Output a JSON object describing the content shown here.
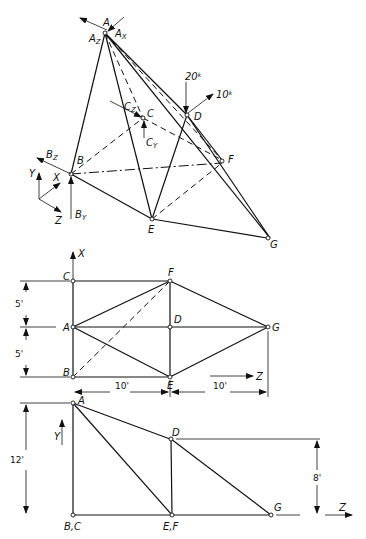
{
  "isometric": {
    "nodes": {
      "A": "A",
      "B": "B",
      "C": "C",
      "D": "D",
      "E": "E",
      "F": "F",
      "G": "G"
    },
    "reactions": {
      "Ax": "A",
      "Ax_sub": "X",
      "Az": "A",
      "Az_sub": "Z",
      "Bz": "B",
      "Bz_sub": "Z",
      "By": "B",
      "By_sub": "Y",
      "Cz": "C",
      "Cz_sub": "Z",
      "Cy": "C",
      "Cy_sub": "Y"
    },
    "loads": {
      "vertical": "20",
      "horizontal": "10",
      "unit": "k"
    },
    "axes": {
      "x": "X",
      "y": "Y",
      "z": "Z"
    }
  },
  "plan_view": {
    "nodes": {
      "C": "C",
      "F": "F",
      "A": "A",
      "D": "D",
      "G": "G",
      "B": "B",
      "E": "E"
    },
    "axis_x": "X",
    "axis_z": "Z",
    "dims": {
      "upper": "5'",
      "lower": "5'",
      "span1": "10'",
      "span2": "10'"
    }
  },
  "elevation_view": {
    "nodes": {
      "A": "A",
      "D": "D",
      "BC": "B,C",
      "EF": "E,F",
      "G": "G"
    },
    "axis_y": "Y",
    "axis_z": "Z",
    "dims": {
      "height_A": "12'",
      "height_D": "8'"
    }
  }
}
